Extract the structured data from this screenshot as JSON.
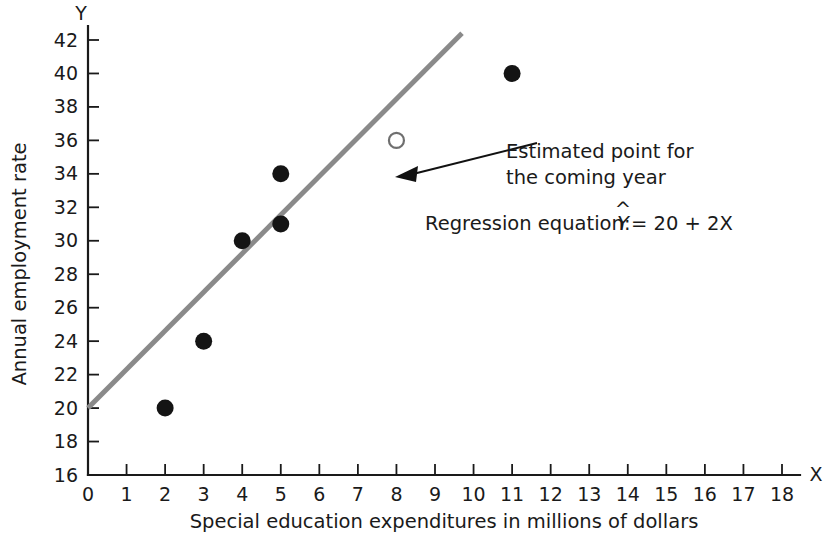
{
  "chart_data": {
    "type": "scatter",
    "title": "",
    "xlabel": "Special education expenditures in millions of dollars",
    "ylabel": "Annual employment rate",
    "x_axis_letter": "X",
    "y_axis_letter": "Y",
    "xlim": [
      0,
      18
    ],
    "ylim": [
      16,
      42
    ],
    "xticks": [
      0,
      1,
      2,
      3,
      4,
      5,
      6,
      7,
      8,
      9,
      10,
      11,
      12,
      13,
      14,
      15,
      16,
      17,
      18
    ],
    "yticks": [
      16,
      18,
      20,
      22,
      24,
      26,
      28,
      30,
      32,
      34,
      36,
      38,
      40,
      42
    ],
    "grid": false,
    "legend": false,
    "series": [
      {
        "name": "Observed data",
        "marker": "filled-circle",
        "color": "#141414",
        "points": [
          {
            "x": 2,
            "y": 20
          },
          {
            "x": 3,
            "y": 24
          },
          {
            "x": 4,
            "y": 30
          },
          {
            "x": 5,
            "y": 31
          },
          {
            "x": 5,
            "y": 34
          },
          {
            "x": 11,
            "y": 40
          }
        ]
      },
      {
        "name": "Estimated point for the coming year",
        "marker": "open-circle",
        "color": "#6f6f6f",
        "points": [
          {
            "x": 8,
            "y": 36
          }
        ]
      }
    ],
    "fit_line": {
      "name": "Regression line",
      "color": "#8a8a8a",
      "intercept": 20,
      "slope": 2,
      "x_start": 0,
      "x_end": 9.7,
      "y_start": 20,
      "y_end": 42.4
    },
    "annotations": [
      {
        "id": "estimated-point",
        "line1": "Estimated point for",
        "line2": "the coming year",
        "target": {
          "x": 8,
          "y": 36
        }
      },
      {
        "id": "regression-equation",
        "text_prefix": "Regression equation: ",
        "symbol": "Y",
        "hat": "^",
        "text_suffix": " = 20 + 2X",
        "full_text": "Regression equation: Ŷ = 20 + 2X"
      }
    ]
  },
  "axes": {
    "y_tick_labels": [
      "42",
      "40",
      "38",
      "36",
      "34",
      "32",
      "30",
      "28",
      "26",
      "24",
      "22",
      "20",
      "18",
      "16"
    ],
    "x_tick_labels": [
      "0",
      "1",
      "2",
      "3",
      "4",
      "5",
      "6",
      "7",
      "8",
      "9",
      "10",
      "11",
      "12",
      "13",
      "14",
      "15",
      "16",
      "17",
      "18"
    ]
  },
  "colors": {
    "axis": "#1a1a1a",
    "regression_line": "#8a8a8a",
    "data_point": "#141414",
    "estimated_point_stroke": "#6f6f6f",
    "background": "#ffffff"
  }
}
